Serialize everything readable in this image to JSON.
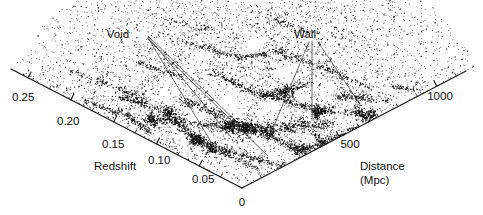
{
  "figure": {
    "name": "redshift-survey-wedge",
    "background_color": "#fefefe",
    "ink_color": "#111111"
  },
  "axes": {
    "redshift": {
      "title": "Redshift",
      "tick_labels": [
        "0.25",
        "0.20",
        "0.15",
        "0.10",
        "0.05",
        "0"
      ],
      "tick_values": [
        0.25,
        0.2,
        0.15,
        0.1,
        0.05,
        0
      ],
      "range": [
        0,
        0.27
      ]
    },
    "distance": {
      "title_line1": "Distance",
      "title_line2": "(Mpc)",
      "tick_labels": [
        "500",
        "1000"
      ],
      "tick_values": [
        500,
        1000
      ],
      "range": [
        0,
        1150
      ]
    }
  },
  "annotations": [
    {
      "label": "Void",
      "x": 118,
      "y": 34
    },
    {
      "label": "Wall",
      "x": 305,
      "y": 34
    }
  ],
  "apex": {
    "label": "0",
    "x": 242,
    "y": 188
  },
  "chart_data": {
    "type": "scatter",
    "title": "",
    "xlabel": "Redshift / Distance (Mpc)",
    "ylabel": "",
    "n_points_approx": 9000,
    "grid": false,
    "legend": null,
    "annotations": [
      "Void",
      "Wall"
    ],
    "axis_left": {
      "name": "Redshift",
      "ticks": [
        0,
        0.05,
        0.1,
        0.15,
        0.2,
        0.25
      ]
    },
    "axis_right": {
      "name": "Distance (Mpc)",
      "ticks": [
        0,
        500,
        1000
      ]
    }
  }
}
